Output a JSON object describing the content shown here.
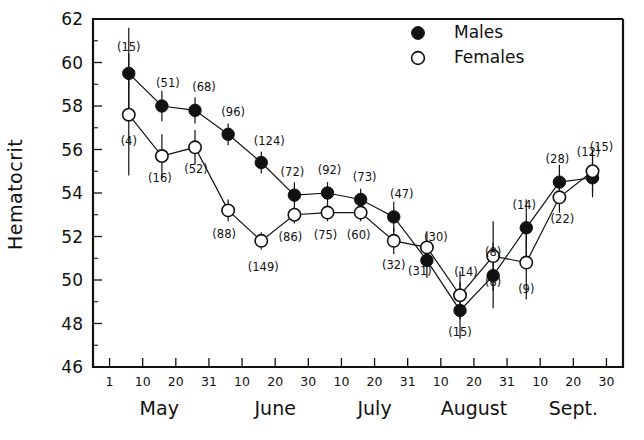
{
  "chart_data": {
    "type": "line",
    "title": "",
    "xlabel": "",
    "ylabel": "Hematocrit",
    "ylim": [
      46,
      62
    ],
    "ytick_labels": [
      "46",
      "48",
      "50",
      "52",
      "54",
      "56",
      "58",
      "60",
      "62"
    ],
    "ytick_values": [
      46,
      48,
      50,
      52,
      54,
      56,
      58,
      60,
      62
    ],
    "y_minor_step": 1,
    "grid": false,
    "legend_position": "top-right",
    "xtick_labels": [
      "1",
      "10",
      "20",
      "31",
      "10",
      "20",
      "30",
      "10",
      "20",
      "31",
      "10",
      "20",
      "31",
      "10",
      "20",
      "30"
    ],
    "x_months": [
      "May",
      "June",
      "July",
      "August",
      "Sept."
    ],
    "x": [
      1,
      2,
      3,
      4,
      5,
      6,
      7,
      8,
      9,
      10,
      11,
      12,
      13,
      14,
      15
    ],
    "series": [
      {
        "name": "Males",
        "marker": "filled-circle",
        "values": [
          59.5,
          58.0,
          57.8,
          56.7,
          55.4,
          53.9,
          54.0,
          53.7,
          52.9,
          50.9,
          48.6,
          50.2,
          52.4,
          54.5,
          54.7
        ],
        "counts": [
          15,
          51,
          68,
          96,
          124,
          72,
          92,
          73,
          47,
          30,
          15,
          8,
          14,
          28,
          12
        ],
        "errors": [
          2.1,
          0.7,
          0.6,
          0.5,
          0.5,
          0.6,
          0.5,
          0.5,
          0.7,
          0.8,
          1.3,
          1.5,
          1.3,
          0.8,
          0.9
        ]
      },
      {
        "name": "Females",
        "marker": "open-circle",
        "values": [
          57.6,
          55.7,
          56.1,
          53.2,
          51.8,
          53.0,
          53.1,
          53.1,
          51.8,
          51.5,
          49.3,
          51.1,
          50.8,
          53.8,
          55.0
        ],
        "counts": [
          4,
          16,
          52,
          88,
          149,
          86,
          75,
          60,
          32,
          31,
          14,
          8,
          9,
          22,
          15
        ],
        "errors": [
          2.8,
          1.0,
          0.8,
          0.5,
          0.4,
          0.4,
          0.4,
          0.4,
          0.6,
          0.7,
          1.1,
          1.6,
          1.7,
          0.7,
          1.0
        ]
      }
    ]
  },
  "legend": {
    "entries": [
      {
        "label": "Males",
        "marker": "filled-circle"
      },
      {
        "label": "Females",
        "marker": "open-circle"
      }
    ]
  }
}
